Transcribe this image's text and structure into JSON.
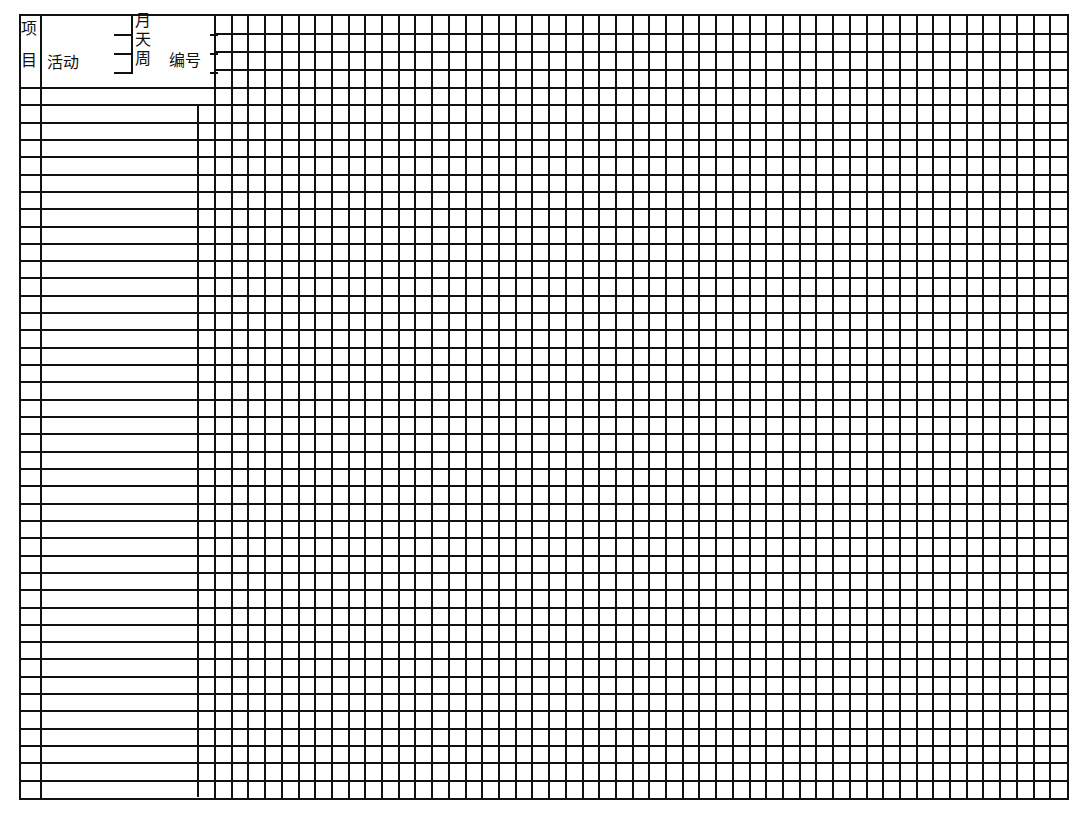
{
  "header": {
    "project_label_1": "项",
    "project_label_2": "目",
    "activity_label": "活动",
    "month_label": "月",
    "day_label": "天",
    "week_label": "周",
    "number_label": "编号"
  },
  "grid": {
    "columns": 51,
    "header_rows": 4,
    "body_rows": 41,
    "line_color": "#111111"
  },
  "body": {
    "rows": 41,
    "row_height": 17.35
  }
}
